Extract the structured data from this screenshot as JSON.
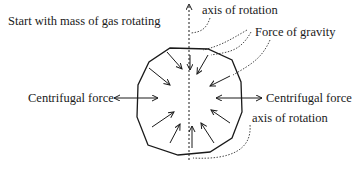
{
  "diagram": {
    "labels": {
      "start": "Start with mass of gas rotating",
      "axis_top": "axis of rotation",
      "gravity": "Force of gravity",
      "centrifugal_left": "Centrifugal force",
      "centrifugal_right": "Centrifugal force",
      "axis_bottom": "axis of rotation"
    },
    "colors": {
      "ink": "#1a1a1a",
      "background": "#ffffff"
    }
  }
}
